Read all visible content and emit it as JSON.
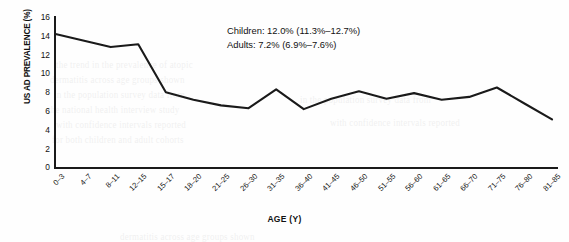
{
  "chart_data": {
    "type": "line",
    "title": "",
    "xlabel": "AGE (Y)",
    "ylabel": "US AD PREVALENCE (%)",
    "ylim": [
      0,
      16
    ],
    "yticks": [
      0,
      2,
      4,
      6,
      8,
      10,
      12,
      14,
      16
    ],
    "grid": false,
    "legend": "none",
    "line_color": "#1a1a1a",
    "categories": [
      "0–3",
      "4–7",
      "8–11",
      "12–15",
      "15–17",
      "18–20",
      "21–25",
      "26–30",
      "31–35",
      "36–40",
      "41–45",
      "46–50",
      "51–55",
      "56–60",
      "61–65",
      "66–70",
      "71–75",
      "76–80",
      "81–85"
    ],
    "values": [
      14.2,
      13.5,
      12.8,
      13.1,
      8.0,
      7.2,
      6.6,
      6.3,
      8.3,
      6.2,
      7.3,
      8.1,
      7.3,
      7.9,
      7.2,
      7.5,
      8.5,
      6.8,
      5.1
    ],
    "series": [
      {
        "name": "US AD prevalence",
        "values": [
          14.2,
          13.5,
          12.8,
          13.1,
          8.0,
          7.2,
          6.6,
          6.3,
          8.3,
          6.2,
          7.3,
          8.1,
          7.3,
          7.9,
          7.2,
          7.5,
          8.5,
          6.8,
          5.1
        ]
      }
    ],
    "annotations": [
      "Children: 12.0% (11.3%–12.7%)",
      "Adults: 7.2% (6.9%–7.6%)"
    ]
  },
  "annotation": {
    "line1": "Children: 12.0% (11.3%–12.7%)",
    "line2": "Adults: 7.2% (6.9%–7.6%)"
  },
  "axes": {
    "y_title": "US AD PREVALENCE (%)",
    "x_title": "AGE (Y)"
  },
  "bleed_text": {
    "l1": "the trend in the prevalence of atopic",
    "l2": "dermatitis across age groups shown",
    "l3": "in the population survey data from",
    "l4": "the national health interview study",
    "l5": "with confidence intervals reported",
    "l6": "for both children and adult cohorts"
  }
}
